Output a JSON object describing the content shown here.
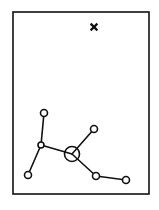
{
  "canvas": {
    "width": 159,
    "height": 210,
    "background": "#ffffff"
  },
  "colors": {
    "stroke": "#111111",
    "node_fill": "#ffffff",
    "marker": "#111111"
  },
  "frame": {
    "x": 13,
    "y": 12,
    "width": 136,
    "height": 182,
    "stroke_width": 1.6
  },
  "marker": {
    "type": "x-mark",
    "x": 94,
    "y": 27,
    "size": 2.6,
    "stroke_width": 2.2
  },
  "nodes": [
    {
      "id": "A",
      "x": 44,
      "y": 113,
      "r": 3.5,
      "kind": "leaf"
    },
    {
      "id": "B",
      "x": 41,
      "y": 145,
      "r": 3.0,
      "kind": "junction"
    },
    {
      "id": "C",
      "x": 28,
      "y": 175,
      "r": 3.5,
      "kind": "leaf"
    },
    {
      "id": "H",
      "x": 72,
      "y": 154,
      "r": 7.5,
      "kind": "hub"
    },
    {
      "id": "D",
      "x": 94,
      "y": 129,
      "r": 3.5,
      "kind": "leaf"
    },
    {
      "id": "E",
      "x": 96,
      "y": 176,
      "r": 3.5,
      "kind": "junction"
    },
    {
      "id": "F",
      "x": 126,
      "y": 180,
      "r": 3.5,
      "kind": "leaf"
    }
  ],
  "edges": [
    {
      "from": "A",
      "to": "B"
    },
    {
      "from": "B",
      "to": "C"
    },
    {
      "from": "B",
      "to": "H"
    },
    {
      "from": "H",
      "to": "D"
    },
    {
      "from": "H",
      "to": "E"
    },
    {
      "from": "E",
      "to": "F"
    }
  ],
  "line_width": 1.6
}
